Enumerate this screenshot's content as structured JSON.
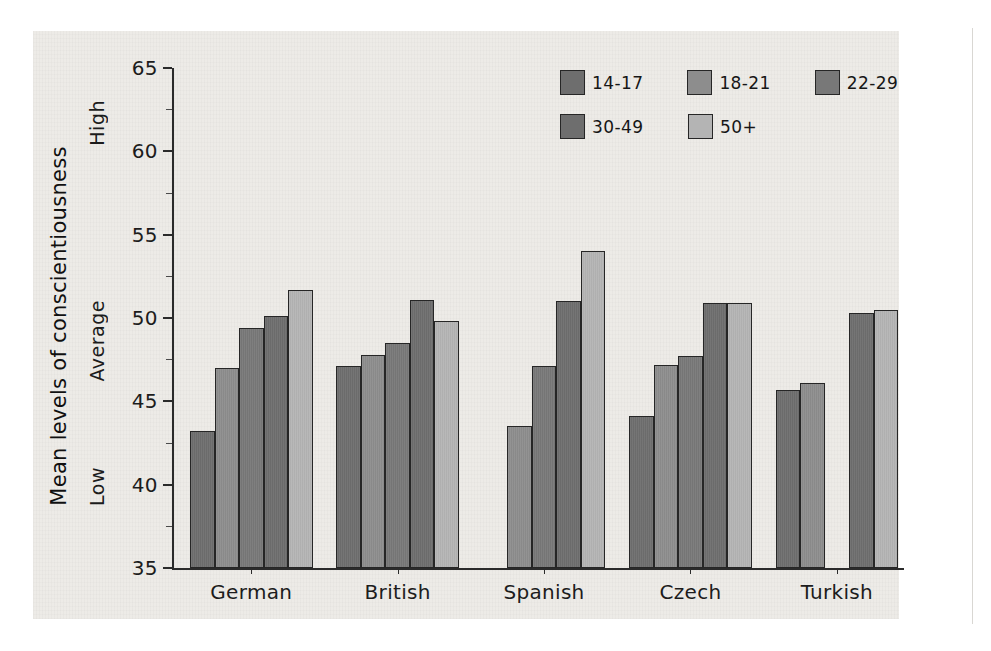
{
  "chart_data": {
    "type": "bar",
    "title": "",
    "xlabel": "",
    "ylabel": "Mean levels of conscientiousness",
    "ylim": [
      35,
      65
    ],
    "yticks": [
      35,
      40,
      45,
      50,
      55,
      60,
      65
    ],
    "ytick_labels": [
      "35",
      "40",
      "45",
      "50",
      "55",
      "60",
      "65"
    ],
    "grid": false,
    "legend_position": "top-right",
    "axis_annotations": [
      {
        "label": "High",
        "value": 61.5
      },
      {
        "label": "Average",
        "value": 49.5
      },
      {
        "label": "Low",
        "value": 39.5
      }
    ],
    "categories": [
      "German",
      "British",
      "Spanish",
      "Czech",
      "Turkish"
    ],
    "series": [
      {
        "name": "14-17",
        "color": "#6e6e6e",
        "values": [
          43.2,
          47.1,
          null,
          44.1,
          45.7
        ]
      },
      {
        "name": "18-21",
        "color": "#8d8d8d",
        "values": [
          47.0,
          47.8,
          43.5,
          47.2,
          46.1
        ]
      },
      {
        "name": "22-29",
        "color": "#787878",
        "values": [
          49.4,
          48.5,
          47.1,
          47.7,
          null
        ]
      },
      {
        "name": "30-49",
        "color": "#6e6e6e",
        "values": [
          50.1,
          51.1,
          51.0,
          50.9,
          50.3
        ]
      },
      {
        "name": "50+",
        "color": "#b4b4b4",
        "values": [
          51.7,
          49.8,
          54.0,
          50.9,
          50.5
        ]
      }
    ]
  },
  "legend": {
    "items": [
      {
        "label": "14-17",
        "color": "#6e6e6e"
      },
      {
        "label": "18-21",
        "color": "#8d8d8d"
      },
      {
        "label": "22-29",
        "color": "#787878"
      },
      {
        "label": "30-49",
        "color": "#6e6e6e"
      },
      {
        "label": "50+",
        "color": "#b4b4b4"
      }
    ]
  }
}
